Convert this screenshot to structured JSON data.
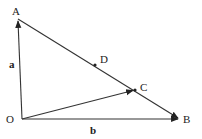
{
  "diagram": {
    "points": {
      "O": {
        "label": "O",
        "x": 22,
        "y": 119
      },
      "A": {
        "label": "A",
        "x": 18,
        "y": 19
      },
      "B": {
        "label": "B",
        "x": 180,
        "y": 119
      },
      "C": {
        "label": "C",
        "x": 135,
        "y": 90
      },
      "D": {
        "label": "D",
        "x": 95,
        "y": 65
      }
    },
    "vectors": {
      "a": {
        "label": "a",
        "from": "O",
        "to": "A"
      },
      "b": {
        "label": "b",
        "from": "O",
        "to": "B"
      },
      "OC": {
        "from": "O",
        "to": "C"
      }
    },
    "segments": [
      {
        "from": "A",
        "to": "B"
      }
    ],
    "colors": {
      "stroke": "#333333",
      "background": "#ffffff"
    }
  }
}
